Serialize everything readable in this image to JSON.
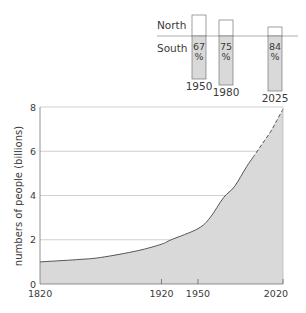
{
  "chart_data": [
    {
      "type": "area",
      "title": "",
      "xlabel": "",
      "ylabel": "numbers of people (billions)",
      "ylim": [
        0,
        8
      ],
      "xlim": [
        1820,
        2020
      ],
      "yticks": [
        0,
        2,
        4,
        6,
        8
      ],
      "ytick_labels": [
        "0",
        "2",
        "4",
        "6",
        "8"
      ],
      "xticks": [
        1820,
        1920,
        1950,
        2020
      ],
      "xtick_labels": [
        "1820",
        "1920",
        "1950",
        "2020"
      ],
      "grid": "horizontal",
      "series": [
        {
          "name": "world population",
          "style": "solid",
          "x": [
            1820,
            1850,
            1870,
            1900,
            1920,
            1928,
            1950,
            1960,
            1971,
            1980,
            1990,
            1995
          ],
          "y": [
            1.0,
            1.1,
            1.2,
            1.5,
            1.8,
            2.0,
            2.5,
            3.0,
            3.9,
            4.4,
            5.3,
            5.7
          ]
        },
        {
          "name": "world population (projected)",
          "style": "dashed",
          "x": [
            1995,
            2000,
            2005,
            2010,
            2015,
            2020
          ],
          "y": [
            5.7,
            6.1,
            6.5,
            6.9,
            7.4,
            7.9
          ]
        }
      ],
      "fill_color": "#d9d9d9",
      "line_color": "#555555"
    },
    {
      "type": "bar",
      "title": "",
      "categories": [
        "1950",
        "1980",
        "2025"
      ],
      "row_labels": [
        "North",
        "South"
      ],
      "series": [
        {
          "name": "South",
          "values": [
            67,
            75,
            84
          ],
          "unit": "%"
        },
        {
          "name": "North",
          "values": [
            33,
            25,
            16
          ],
          "unit": "%"
        }
      ],
      "value_labels": [
        "67 %",
        "75 %",
        "84 %"
      ],
      "south_fill": "#d9d9d9"
    }
  ]
}
